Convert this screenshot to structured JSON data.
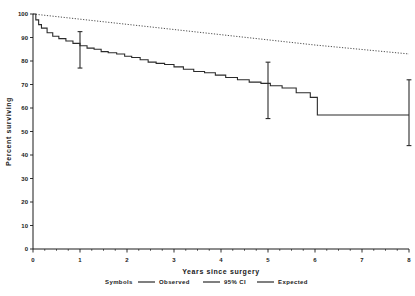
{
  "chart_data": {
    "type": "line",
    "title": "",
    "xlabel": "Years since surgery",
    "ylabel": "Percent surviving",
    "xlim": [
      0,
      8
    ],
    "ylim": [
      0,
      100
    ],
    "xticks": [
      "0",
      "1",
      "2",
      "3",
      "4",
      "5",
      "6",
      "7",
      "8"
    ],
    "yticks": [
      "0",
      "10",
      "20",
      "30",
      "40",
      "50",
      "60",
      "70",
      "80",
      "90",
      "100"
    ],
    "grid": false,
    "legend_position": "bottom",
    "legend_title": "Symbols",
    "series": [
      {
        "name": "Observed",
        "style": "step-solid",
        "x": [
          0.0,
          0.06,
          0.12,
          0.18,
          0.3,
          0.42,
          0.55,
          0.7,
          0.85,
          1.0,
          1.15,
          1.3,
          1.45,
          1.6,
          1.78,
          1.95,
          2.1,
          2.28,
          2.45,
          2.62,
          2.8,
          3.0,
          3.2,
          3.42,
          3.65,
          3.88,
          4.1,
          4.35,
          4.6,
          4.85,
          5.05,
          5.3,
          5.6,
          5.9,
          6.05,
          8.0
        ],
        "y": [
          100.0,
          97.5,
          95.5,
          94.0,
          92.0,
          90.5,
          89.5,
          88.5,
          87.5,
          86.5,
          85.5,
          85.0,
          84.0,
          83.5,
          83.0,
          82.0,
          81.5,
          80.5,
          79.5,
          79.0,
          78.5,
          77.5,
          76.5,
          75.5,
          75.0,
          74.0,
          73.0,
          72.0,
          71.0,
          70.5,
          69.5,
          68.5,
          66.5,
          64.5,
          57.0,
          57.0
        ]
      },
      {
        "name": "Expected",
        "style": "dotted",
        "x": [
          0,
          1,
          2,
          3,
          4,
          5,
          6,
          7,
          8
        ],
        "y": [
          100.0,
          97.8,
          95.6,
          93.4,
          91.2,
          89.0,
          86.8,
          84.9,
          83.0
        ]
      }
    ],
    "error_bars": {
      "name": "95% CI",
      "points": [
        {
          "x": 1.0,
          "y": 86.5,
          "low": 77.0,
          "high": 92.5
        },
        {
          "x": 5.0,
          "y": 69.5,
          "low": 55.5,
          "high": 79.5
        },
        {
          "x": 8.0,
          "y": 57.0,
          "low": 44.0,
          "high": 72.0
        }
      ]
    },
    "legend_entries": [
      "Observed",
      "95% CI",
      "Expected"
    ]
  },
  "colors": {
    "axis": "#1a1a1a",
    "observed": "#2b2b2b",
    "expected": "#3a3a3a",
    "ci": "#2b2b2b",
    "background": "#ffffff"
  },
  "legend": {
    "label_symbols": "Symbols",
    "entry_observed": "Observed",
    "entry_ci": "95% CI",
    "entry_expected": "Expected"
  },
  "axes": {
    "x_title": "Years since surgery",
    "y_title": "Percent surviving"
  }
}
